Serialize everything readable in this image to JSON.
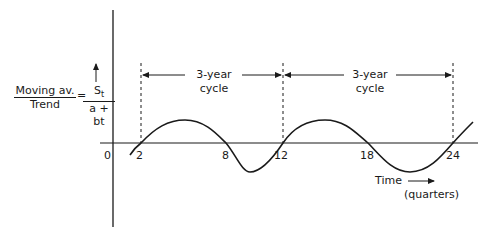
{
  "diagram": {
    "y_label": {
      "left_fraction": {
        "numerator": "Moving av.",
        "denominator": "Trend"
      },
      "equals": "=",
      "right_fraction": {
        "numerator": "St",
        "numerator_main": "S",
        "numerator_sub": "t",
        "denominator": "a + bt"
      }
    },
    "x_axis": {
      "label_line1": "Time",
      "label_line2": "(quarters)",
      "origin_label": "0",
      "ticks": [
        "2",
        "8",
        "12",
        "18",
        "24"
      ]
    },
    "cycles": [
      {
        "line1": "3-year",
        "line2": "cycle"
      },
      {
        "line1": "3-year",
        "line2": "cycle"
      }
    ],
    "colors": {
      "line": "#1a1a1a",
      "background": "#ffffff"
    }
  }
}
